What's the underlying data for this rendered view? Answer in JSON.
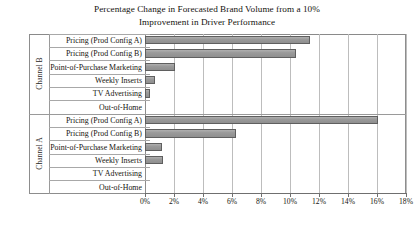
{
  "chart_data": {
    "type": "bar",
    "orientation": "horizontal",
    "title": "Percentage Change in Forecasted Brand Volume from a 10% Improvement in Driver Performance",
    "title_lines": [
      "Percentage Change in Forecasted Brand Volume from a 10%",
      "Improvement in Driver Performance"
    ],
    "xlabel": "",
    "ylabel": "",
    "xlim": [
      0,
      18
    ],
    "xtick_step": 2,
    "xtick_labels": [
      "0%",
      "2%",
      "4%",
      "6%",
      "8%",
      "10%",
      "12%",
      "14%",
      "16%",
      "18%"
    ],
    "xtick_values": [
      0,
      2,
      4,
      6,
      8,
      10,
      12,
      14,
      16,
      18
    ],
    "grid": true,
    "legend": "none",
    "bar_color": "#9d9d9d",
    "bar_edge_color": "#5f5f5f",
    "categories": [
      "Pricing (Prod Config A)",
      "Pricing (Prod Config B)",
      "Point-of-Purchase Marketing",
      "Weekly Inserts",
      "TV Advertising",
      "Out-of-Home"
    ],
    "groups": [
      {
        "name": "Channel B",
        "categories": [
          "Pricing (Prod Config A)",
          "Pricing (Prod Config B)",
          "Point-of-Purchase Marketing",
          "Weekly Inserts",
          "TV Advertising",
          "Out-of-Home"
        ],
        "values": [
          11.4,
          10.4,
          2.1,
          0.7,
          0.35,
          0.0
        ]
      },
      {
        "name": "Channel A",
        "categories": [
          "Pricing (Prod Config A)",
          "Pricing (Prod Config B)",
          "Point-of-Purchase Marketing",
          "Weekly Inserts",
          "TV Advertising",
          "Out-of-Home"
        ],
        "values": [
          16.1,
          6.3,
          1.2,
          1.25,
          0.0,
          0.0
        ]
      }
    ]
  }
}
